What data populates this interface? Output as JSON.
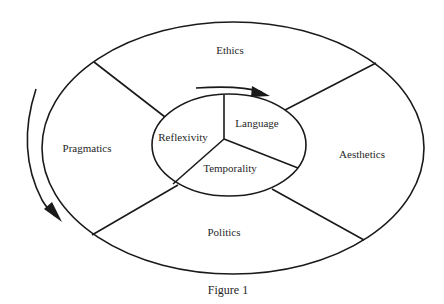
{
  "figure": {
    "caption": "Figure 1",
    "outer_segments": {
      "top": "Ethics",
      "left": "Pragmatics",
      "right": "Aesthetics",
      "bottom": "Politics"
    },
    "inner_segments": {
      "left": "Reflexivity",
      "right": "Language",
      "bottom": "Temporality"
    },
    "stroke_color": "#1a1a1a",
    "arrows": [
      {
        "name": "inner-clockwise-arrow",
        "direction": "clockwise"
      },
      {
        "name": "outer-counterclockwise-arrow",
        "direction": "downward-left"
      }
    ]
  }
}
